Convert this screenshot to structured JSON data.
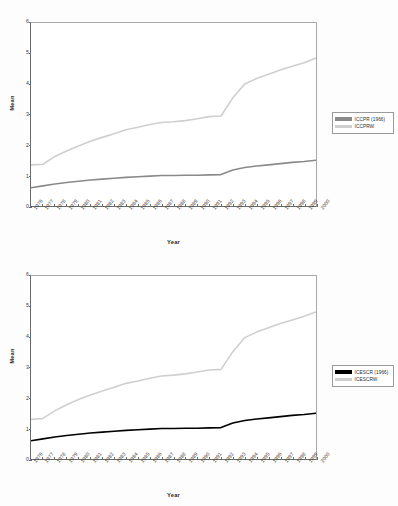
{
  "page": {
    "background": "#fdfdfd"
  },
  "figures": [
    {
      "id": "figure-1",
      "ylabel": "Mean",
      "xlabel": "Year",
      "legend": {
        "items": [
          {
            "label": "ICCPR (1966)",
            "color": "#8a8a8a"
          },
          {
            "label": "ICCPRW",
            "color": "#cfcfcf"
          }
        ]
      },
      "chart_data": {
        "type": "line",
        "title": "",
        "subtitle": "",
        "xlabel": "Year",
        "ylabel": "Mean",
        "ylim": [
          0,
          6
        ],
        "yticks": [
          0,
          1,
          2,
          3,
          4,
          5,
          6
        ],
        "grid": false,
        "legend_position": "right",
        "categories": [
          "1976",
          "1977",
          "1978",
          "1979",
          "1980",
          "1981",
          "1982",
          "1983",
          "1984",
          "1985",
          "1986",
          "1987",
          "1988",
          "1989",
          "1990",
          "1991",
          "1992",
          "1993",
          "1994",
          "1995",
          "1996",
          "1997",
          "1998",
          "1999",
          "2000"
        ],
        "series": [
          {
            "name": "ICCPR (1966)",
            "color": "#8a8a8a",
            "values": [
              0.6,
              0.66,
              0.72,
              0.77,
              0.81,
              0.85,
              0.88,
              0.91,
              0.94,
              0.96,
              0.98,
              1.0,
              1.0,
              1.01,
              1.01,
              1.02,
              1.03,
              1.18,
              1.26,
              1.31,
              1.35,
              1.39,
              1.43,
              1.46,
              1.5
            ]
          },
          {
            "name": "ICCPRW",
            "color": "#cfcfcf",
            "values": [
              1.35,
              1.37,
              1.62,
              1.8,
              1.97,
              2.12,
              2.25,
              2.37,
              2.5,
              2.58,
              2.67,
              2.74,
              2.76,
              2.8,
              2.86,
              2.93,
              2.95,
              3.55,
              4.0,
              4.18,
              4.32,
              4.46,
              4.58,
              4.7,
              4.85
            ]
          }
        ]
      }
    },
    {
      "id": "figure-2",
      "ylabel": "Mean",
      "xlabel": "Year",
      "legend": {
        "items": [
          {
            "label": "ICESCR (1966)",
            "color": "#000000"
          },
          {
            "label": "ICESCRW",
            "color": "#cfcfcf"
          }
        ]
      },
      "chart_data": {
        "type": "line",
        "title": "",
        "subtitle": "",
        "xlabel": "Year",
        "ylabel": "Mean",
        "ylim": [
          0,
          6
        ],
        "yticks": [
          0,
          1,
          2,
          3,
          4,
          5,
          6
        ],
        "grid": false,
        "legend_position": "right",
        "categories": [
          "1976",
          "1977",
          "1978",
          "1979",
          "1980",
          "1981",
          "1982",
          "1983",
          "1984",
          "1985",
          "1986",
          "1987",
          "1988",
          "1989",
          "1990",
          "1991",
          "1992",
          "1993",
          "1994",
          "1995",
          "1996",
          "1997",
          "1998",
          "1999",
          "2000"
        ],
        "series": [
          {
            "name": "ICESCR (1966)",
            "color": "#000000",
            "values": [
              0.6,
              0.66,
              0.72,
              0.77,
              0.81,
              0.85,
              0.88,
              0.91,
              0.94,
              0.96,
              0.98,
              1.0,
              1.0,
              1.01,
              1.01,
              1.02,
              1.03,
              1.18,
              1.26,
              1.31,
              1.35,
              1.39,
              1.43,
              1.46,
              1.5
            ]
          },
          {
            "name": "ICESCRW",
            "color": "#cfcfcf",
            "values": [
              1.3,
              1.33,
              1.58,
              1.78,
              1.95,
              2.1,
              2.23,
              2.35,
              2.48,
              2.56,
              2.65,
              2.72,
              2.75,
              2.79,
              2.85,
              2.92,
              2.94,
              3.52,
              3.98,
              4.16,
              4.3,
              4.44,
              4.56,
              4.68,
              4.82
            ]
          }
        ]
      }
    }
  ]
}
